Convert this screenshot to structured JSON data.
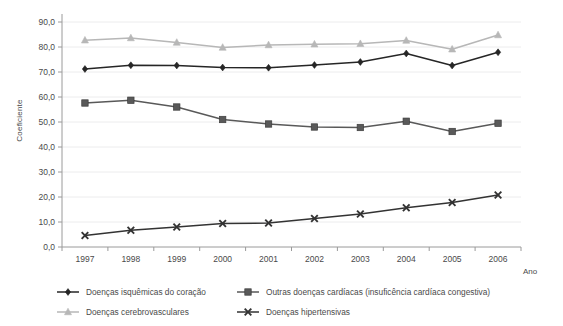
{
  "chart_data": {
    "type": "line",
    "title": "",
    "xlabel": "Ano",
    "ylabel": "Coeficiente",
    "categories": [
      "1997",
      "1998",
      "1999",
      "2000",
      "2001",
      "2002",
      "2003",
      "2004",
      "2005",
      "2006"
    ],
    "x": [
      1997,
      1998,
      1999,
      2000,
      2001,
      2002,
      2003,
      2004,
      2005,
      2006
    ],
    "ylim": [
      0,
      90
    ],
    "ytick_labels": [
      "0,0",
      "10,0",
      "20,0",
      "30,0",
      "40,0",
      "50,0",
      "60,0",
      "70,0",
      "80,0",
      "90,0"
    ],
    "ytick_values": [
      0,
      10,
      20,
      30,
      40,
      50,
      60,
      70,
      80,
      90
    ],
    "grid": true,
    "legend_position": "bottom",
    "series": [
      {
        "name": "Doenças isquêmicas do coração",
        "marker": "diamond",
        "color": "#262626",
        "values": [
          71.2,
          72.7,
          72.6,
          71.8,
          71.7,
          72.8,
          74.0,
          77.4,
          72.6,
          77.9
        ]
      },
      {
        "name": "Outras doenças cardíacas (insuficência cardíaca congestiva)",
        "marker": "square",
        "color": "#595959",
        "values": [
          57.6,
          58.7,
          56.0,
          51.0,
          49.2,
          48.0,
          47.8,
          50.3,
          46.2,
          49.5
        ]
      },
      {
        "name": "Doenças cerebrovasculares",
        "marker": "triangle",
        "color": "#b7b7b7",
        "values": [
          82.7,
          83.6,
          81.8,
          79.8,
          80.8,
          81.1,
          81.3,
          82.6,
          79.1,
          84.8
        ]
      },
      {
        "name": "Doenças hipertensivas",
        "marker": "x",
        "color": "#333333",
        "values": [
          4.6,
          6.7,
          8.0,
          9.4,
          9.6,
          11.4,
          13.2,
          15.7,
          17.8,
          20.8
        ]
      }
    ]
  },
  "colors": {
    "grid": "#ececed",
    "axis": "#9a9a9a",
    "text": "#4a4a4a",
    "background": "#ffffff"
  }
}
